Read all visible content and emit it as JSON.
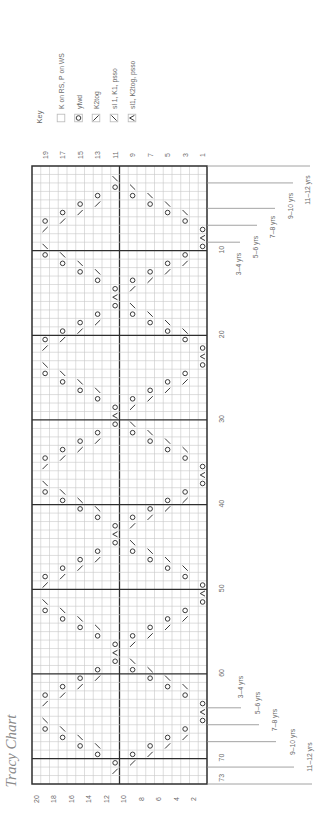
{
  "title": "Tracy Chart",
  "key": {
    "heading": "Key",
    "items": [
      {
        "symbol": "blank",
        "icon": "empty-square-icon",
        "label": "K on RS, P on WS"
      },
      {
        "symbol": "O",
        "icon": "yarn-over-circle-icon",
        "label": "yfwd"
      },
      {
        "symbol": "/",
        "icon": "right-slant-icon",
        "label": "K2tog"
      },
      {
        "symbol": "\\",
        "icon": "left-slant-icon",
        "label": "sl 1, K1, psso"
      },
      {
        "symbol": "A",
        "icon": "caret-up-icon",
        "label": "sl1, K2tog, psso"
      }
    ]
  },
  "chart": {
    "rows": 20,
    "stitches": 73,
    "row_labels_odd": [
      "19",
      "17",
      "15",
      "13",
      "11",
      "9",
      "7",
      "5",
      "3",
      "1"
    ],
    "row_labels_even": [
      "20",
      "18",
      "16",
      "14",
      "12",
      "10",
      "8",
      "6",
      "4",
      "2"
    ],
    "stitch_labels": [
      {
        "label": "10",
        "stitch": 10
      },
      {
        "label": "20",
        "stitch": 20
      },
      {
        "label": "30",
        "stitch": 30
      },
      {
        "label": "40",
        "stitch": 40
      },
      {
        "label": "50",
        "stitch": 50
      },
      {
        "label": "60",
        "stitch": 60
      },
      {
        "label": "70",
        "stitch": 70
      },
      {
        "label": "73",
        "stitch": 73
      }
    ],
    "thick_every": 10,
    "cells_by_row": [
      {
        "row": 19,
        "cells": "O6 /7 \\9 O10 O20 /21 \\23 O24 O34 /35 \\37 O38 O48 /49 \\51 O52 O62 /63 \\65 O66"
      },
      {
        "row": 17,
        "cells": "O5 /6 \\10 O11 O19 /20 \\24 O25 O33 /34 \\38 O39 O47 /48 \\52 O53 O61 /62 \\66 O67"
      },
      {
        "row": 15,
        "cells": "O4 /5 \\11 O12 O18 /19 \\25 O26 O32 /33 \\39 O40 O46 /47 \\53 O54 O60 /61 \\67 O68"
      },
      {
        "row": 13,
        "cells": "O3 /4 \\12 O13 O17 /18 \\26 O27 O31 /32 \\40 O41 O45 /46 \\54 O55 O59 /60 \\68 O69"
      },
      {
        "row": 11,
        "cells": "\\1 O2 O14 A15 O16 O28 A29 O30 O42 A43 O44 O56 A57 O58 O70 /71"
      },
      {
        "row": 9,
        "cells": "\\2 O3 O13 /14 \\16 O17 O27 /28 \\30 O31 O41 /42 \\44 O45 O55 /56 \\58 O59 O69 /70"
      },
      {
        "row": 7,
        "cells": "\\3 O4 O12 /13 \\17 O18 O26 /27 \\31 O32 O40 /41 \\45 O46 O54 /55 \\59 O60 O68 /69"
      },
      {
        "row": 5,
        "cells": "\\4 O5 O11 /12 \\18 O19 O25 /26 \\32 O33 O39 /40 \\46 O47 O53 /54 \\60 O61 O67 /68"
      },
      {
        "row": 3,
        "cells": "\\5 O6 O10 /11 \\19 O20 O24 /25 \\33 O34 O38 /39 \\47 O48 O52 /53 \\61 O62 O66 /67"
      },
      {
        "row": 1,
        "cells": "O7 A8 O9 O21 A22 O23 O35 A36 O37 O49 A50 O51 O63 A64 O65"
      }
    ]
  },
  "sizes": {
    "top": [
      {
        "label": "11–12 yrs",
        "stitch_boundary": 0
      },
      {
        "label": "9–10 yrs",
        "stitch_boundary": 2
      },
      {
        "label": "7–8 yrs",
        "stitch_boundary": 5
      },
      {
        "label": "5–6 yrs",
        "stitch_boundary": 7
      },
      {
        "label": "3–4 yrs",
        "stitch_boundary": 9
      }
    ],
    "bottom": [
      {
        "label": "3–4 yrs",
        "stitch_boundary": 64
      },
      {
        "label": "5–6 yrs",
        "stitch_boundary": 66
      },
      {
        "label": "7–8 yrs",
        "stitch_boundary": 68
      },
      {
        "label": "9–10 yrs",
        "stitch_boundary": 71
      },
      {
        "label": "11–12 yrs",
        "stitch_boundary": 73
      }
    ]
  },
  "colors": {
    "grid": "#c8c8c8",
    "thick": "#2e2e2e",
    "symbol": "#3a3a3a",
    "text": "#6a6a6a",
    "size_line": "#8c8c8c"
  }
}
